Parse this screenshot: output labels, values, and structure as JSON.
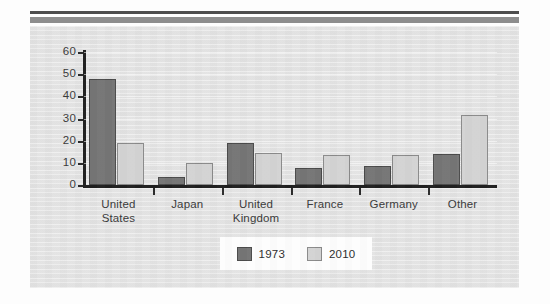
{
  "decor": {
    "top_rule_thin_color": "#4d4d4d",
    "top_rule_thick_color": "#8d8d8d",
    "panel_bg_color": "#e6e6e6"
  },
  "chart_data": {
    "type": "bar",
    "title": "",
    "subtitle": "",
    "xlabel": "",
    "ylabel": "",
    "categories": [
      "United States",
      "Japan",
      "United Kingdom",
      "France",
      "Germany",
      "Other"
    ],
    "category_lines": [
      [
        "United",
        "States"
      ],
      [
        "Japan"
      ],
      [
        "United",
        "Kingdom"
      ],
      [
        "France"
      ],
      [
        "Germany"
      ],
      [
        "Other"
      ]
    ],
    "series": [
      {
        "name": "1973",
        "color": "#757575",
        "values": [
          48,
          3.5,
          19,
          7.5,
          8.5,
          14
        ]
      },
      {
        "name": "2010",
        "color": "#d3d3d3",
        "values": [
          19,
          10,
          14.5,
          13.5,
          13.5,
          31.5
        ]
      }
    ],
    "ylim": [
      0,
      60
    ],
    "ytick_values": [
      0,
      10,
      20,
      30,
      40,
      50,
      60
    ],
    "ytick_labels": [
      "0",
      "10",
      "20",
      "30",
      "40",
      "50",
      "60"
    ],
    "grid": true,
    "grid_axis": "y",
    "legend_position": "bottom-center",
    "legend": [
      {
        "label": "1973",
        "swatch": "#757575"
      },
      {
        "label": "2010",
        "swatch": "#d3d3d3"
      }
    ]
  }
}
